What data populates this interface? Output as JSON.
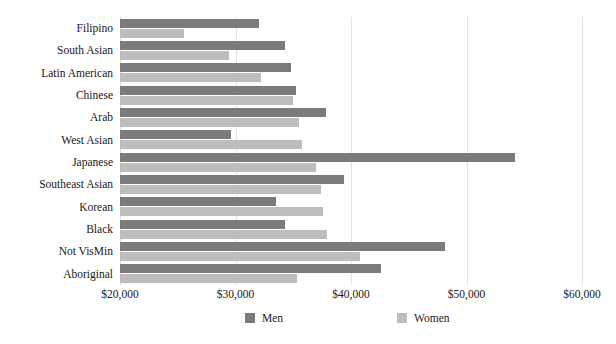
{
  "chart_data": {
    "type": "bar",
    "orientation": "horizontal",
    "title": "",
    "xlabel": "",
    "ylabel": "",
    "xlim": [
      20000,
      60000
    ],
    "xticks": [
      "$20,000",
      "$30,000",
      "$40,000",
      "$50,000",
      "$60,000"
    ],
    "xtick_values": [
      20000,
      30000,
      40000,
      50000,
      60000
    ],
    "grid": true,
    "grid_axis": "x",
    "legend_position": "bottom",
    "categories": [
      "Filipino",
      "South Asian",
      "Latin American",
      "Chinese",
      "Arab",
      "West Asian",
      "Japanese",
      "Southeast Asian",
      "Korean",
      "Black",
      "Not VisMin",
      "Aboriginal"
    ],
    "series": [
      {
        "name": "Men",
        "color": "#7b7b7b",
        "values": [
          32000,
          34300,
          34800,
          35200,
          37800,
          29600,
          54200,
          39400,
          33500,
          34300,
          48100,
          42600
        ]
      },
      {
        "name": "Women",
        "color": "#bdbdbd",
        "values": [
          25500,
          29400,
          32200,
          35000,
          35500,
          35800,
          37000,
          37400,
          37600,
          37900,
          40800,
          35300
        ]
      }
    ]
  },
  "legend": {
    "items": [
      {
        "label": "Men",
        "color": "#7b7b7b"
      },
      {
        "label": "Women",
        "color": "#bdbdbd"
      }
    ]
  },
  "colors": {
    "men": "#7b7b7b",
    "women": "#bdbdbd",
    "gridline": "#e2e2e2",
    "text": "#171717",
    "background": "#ffffff"
  }
}
